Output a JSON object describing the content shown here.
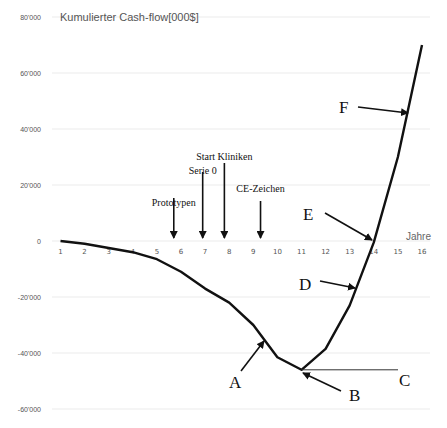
{
  "chart_data": {
    "type": "line",
    "title": "Kumulierter Cash-flow[000$]",
    "xlabel": "Jahre",
    "ylabel": "",
    "x": [
      1,
      2,
      3,
      4,
      5,
      6,
      7,
      8,
      9,
      10,
      11,
      12,
      13,
      14,
      15,
      16
    ],
    "series": [
      {
        "name": "Kumulierter Cash-flow",
        "values": [
          0,
          -1000,
          -2500,
          -4000,
          -6500,
          -11000,
          -17000,
          -22000,
          -30000,
          -41500,
          -46000,
          -38500,
          -23000,
          -500,
          30000,
          70000
        ]
      }
    ],
    "ylim": [
      -60000,
      80000
    ],
    "yticks": [
      "80'000",
      "60'000",
      "40'000",
      "20'000",
      "0",
      "-20'000",
      "-40'000",
      "-60'000"
    ],
    "xticks": [
      "1",
      "2",
      "3",
      "4",
      "5",
      "6",
      "7",
      "8",
      "9",
      "10",
      "11",
      "12",
      "13",
      "14",
      "15",
      "16"
    ],
    "grid": true,
    "milestones": [
      {
        "label": "Prototypen",
        "x": 5.7
      },
      {
        "label": "Serie 0",
        "x": 6.9
      },
      {
        "label": "Start Kliniken",
        "x": 7.8
      },
      {
        "label": "CE-Zeichen",
        "x": 9.3
      }
    ],
    "point_labels": [
      {
        "label": "A",
        "description": "on declining curve near year 9.5"
      },
      {
        "label": "B",
        "description": "minimum at year 11"
      },
      {
        "label": "C",
        "description": "horizontal line at minimum level"
      },
      {
        "label": "D",
        "description": "rising curve near year 13.3"
      },
      {
        "label": "E",
        "description": "break-even crossing near year 14"
      },
      {
        "label": "F",
        "description": "rising curve near year 15.5"
      }
    ]
  }
}
